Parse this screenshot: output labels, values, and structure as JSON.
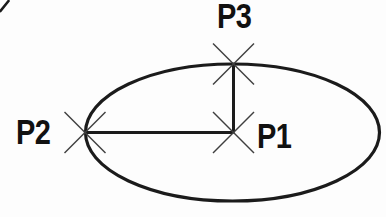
{
  "figure": {
    "background_color": "#fdfdfd",
    "colors": {
      "line": "#1b1b1b",
      "marker": "#3f3f3f",
      "text": "#111111"
    },
    "labels": {
      "p1": "P1",
      "p2": "P2",
      "p3": "P3"
    },
    "points": {
      "p1": {
        "x": 233,
        "y": 133
      },
      "p2": {
        "x": 85,
        "y": 133
      },
      "p3": {
        "x": 233,
        "y": 64
      }
    },
    "ellipse": {
      "cx": 232.5,
      "cy": 132.5,
      "rx": 147,
      "ry": 68.5
    }
  }
}
